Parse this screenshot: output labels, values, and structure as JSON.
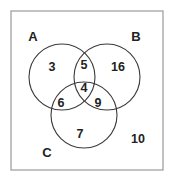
{
  "figure": {
    "type": "venn-diagram",
    "set_count": 3,
    "background_color": "#ffffff",
    "frame_color": "#9a9a9a",
    "circle_stroke_color": "#3b3b3b",
    "text_color": "#222222"
  },
  "sets": [
    {
      "id": "A",
      "label": "A",
      "label_x": 33,
      "label_y": 36,
      "cx": 62,
      "cy": 77,
      "r": 33
    },
    {
      "id": "B",
      "label": "B",
      "label_x": 136,
      "label_y": 36,
      "cx": 107,
      "cy": 77,
      "r": 33
    },
    {
      "id": "C",
      "label": "C",
      "label_x": 47,
      "label_y": 152,
      "cx": 84,
      "cy": 115,
      "r": 33
    }
  ],
  "regions": [
    {
      "id": "A-only",
      "value": "3",
      "x": 52,
      "y": 67
    },
    {
      "id": "AB-only",
      "value": "5",
      "x": 84,
      "y": 65
    },
    {
      "id": "B-only",
      "value": "16",
      "x": 118,
      "y": 67
    },
    {
      "id": "ABC",
      "value": "4",
      "x": 84,
      "y": 88
    },
    {
      "id": "AC-only",
      "value": "6",
      "x": 61,
      "y": 103
    },
    {
      "id": "BC-only",
      "value": "9",
      "x": 98,
      "y": 103
    },
    {
      "id": "C-only",
      "value": "7",
      "x": 80,
      "y": 134
    },
    {
      "id": "outside",
      "value": "10",
      "x": 138,
      "y": 139
    }
  ],
  "frame": {
    "x": 11,
    "y": 11,
    "width": 152,
    "height": 159
  },
  "chart_data": {
    "type": "venn",
    "title": "",
    "sets": [
      "A",
      "B",
      "C"
    ],
    "region_labels": [
      "A only",
      "A and B only",
      "B only",
      "A and B and C",
      "A and C only",
      "B and C only",
      "C only",
      "outside all sets"
    ],
    "region_keys": [
      "A",
      "AB",
      "B",
      "ABC",
      "AC",
      "BC",
      "C",
      "universe_only"
    ],
    "values": [
      3,
      5,
      16,
      4,
      6,
      9,
      7,
      10
    ],
    "totals": {
      "A": 18,
      "B": 34,
      "C": 26,
      "universe": 60
    },
    "legend": "none",
    "grid": false
  }
}
